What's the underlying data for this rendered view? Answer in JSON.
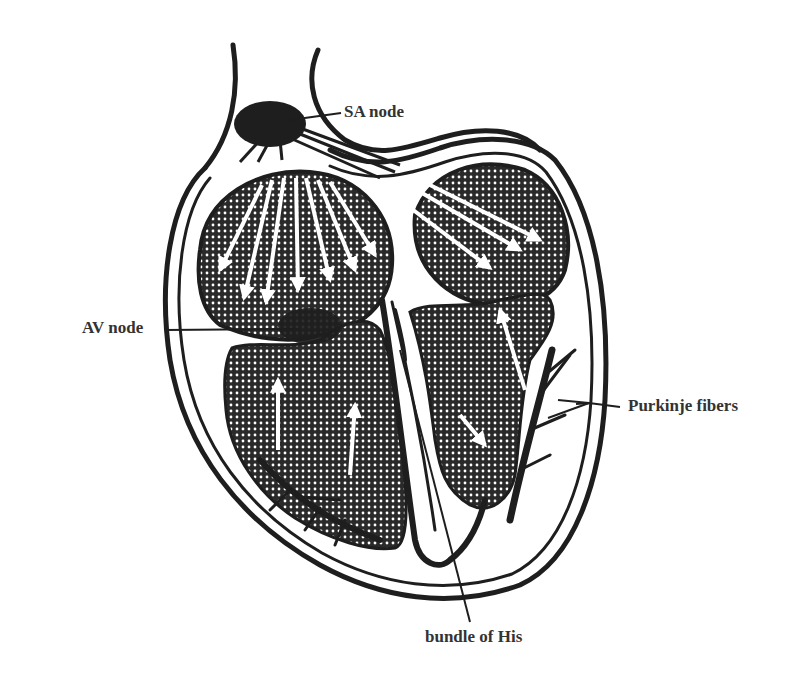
{
  "labels": {
    "sa_node": "SA node",
    "av_node": "AV node",
    "purkinje": "Purkinje fibers",
    "bundle_his": "bundle of His"
  },
  "colors": {
    "line": "#1e1e1e",
    "tissue_dark": "#2a2a2a",
    "text": "#333333",
    "background": "#ffffff"
  }
}
